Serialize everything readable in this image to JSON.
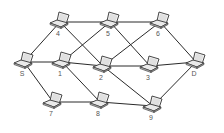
{
  "diagram": {
    "type": "network-graph",
    "node_icon": "laptop-icon",
    "edge_color": "#2a2a2a",
    "nodes": [
      {
        "id": "4",
        "label": "4",
        "x": 60,
        "y": 22
      },
      {
        "id": "5",
        "label": "5",
        "x": 110,
        "y": 22
      },
      {
        "id": "6",
        "label": "6",
        "x": 160,
        "y": 22
      },
      {
        "id": "S",
        "label": "S",
        "x": 24,
        "y": 62
      },
      {
        "id": "1",
        "label": "1",
        "x": 62,
        "y": 62
      },
      {
        "id": "2",
        "label": "2",
        "x": 103,
        "y": 66
      },
      {
        "id": "3",
        "label": "3",
        "x": 150,
        "y": 66
      },
      {
        "id": "D",
        "label": "D",
        "x": 196,
        "y": 62
      },
      {
        "id": "7",
        "label": "7",
        "x": 53,
        "y": 102
      },
      {
        "id": "8",
        "label": "8",
        "x": 100,
        "y": 102
      },
      {
        "id": "9",
        "label": "9",
        "x": 153,
        "y": 106
      }
    ],
    "edges": [
      [
        "S",
        "4"
      ],
      [
        "4",
        "5"
      ],
      [
        "5",
        "6"
      ],
      [
        "4",
        "2"
      ],
      [
        "5",
        "1"
      ],
      [
        "5",
        "3"
      ],
      [
        "6",
        "2"
      ],
      [
        "6",
        "D"
      ],
      [
        "S",
        "1"
      ],
      [
        "1",
        "2"
      ],
      [
        "2",
        "3"
      ],
      [
        "3",
        "D"
      ],
      [
        "S",
        "7"
      ],
      [
        "1",
        "8"
      ],
      [
        "2",
        "9"
      ],
      [
        "7",
        "8"
      ],
      [
        "8",
        "9"
      ],
      [
        "9",
        "D"
      ]
    ]
  }
}
